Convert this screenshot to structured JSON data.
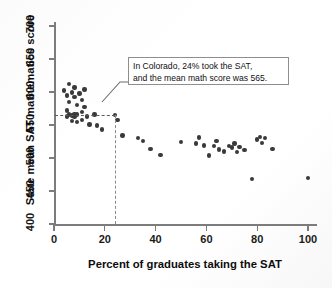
{
  "figure": {
    "background_color": "#ffffff",
    "point_color": "#3a3a3a",
    "axis_color": "#7c7c7c"
  },
  "annotation": {
    "line1": "In Colorado, 24% took the SAT,",
    "line2": "and the mean math score was 565.",
    "box_border_color": "#8e8e8e",
    "guide_x_value": 24,
    "guide_y_value": 565
  },
  "chart_data": {
    "type": "scatter",
    "title": "",
    "xlabel": "Percent of graduates taking the SAT",
    "ylabel": "State mean SAT mathematics score",
    "xlim": [
      0,
      105
    ],
    "ylim": [
      400,
      710
    ],
    "xticks": [
      0,
      20,
      40,
      60,
      80,
      100
    ],
    "yticks": [
      400,
      450,
      500,
      550,
      600,
      650,
      700
    ],
    "xtick_labels": [
      "0",
      "20",
      "40",
      "60",
      "80",
      "100"
    ],
    "ytick_labels": [
      "400",
      "450",
      "550",
      "550",
      "600",
      "650",
      "700"
    ],
    "grid": false,
    "legend": null,
    "highlight_point": {
      "label": "Colorado",
      "x": 24,
      "y": 565
    },
    "points": [
      {
        "x": 4,
        "y": 602
      },
      {
        "x": 5,
        "y": 595
      },
      {
        "x": 5,
        "y": 572
      },
      {
        "x": 5,
        "y": 563
      },
      {
        "x": 6,
        "y": 612
      },
      {
        "x": 6,
        "y": 585
      },
      {
        "x": 6,
        "y": 566
      },
      {
        "x": 7,
        "y": 599
      },
      {
        "x": 7,
        "y": 565
      },
      {
        "x": 7,
        "y": 564
      },
      {
        "x": 7,
        "y": 556
      },
      {
        "x": 8,
        "y": 607
      },
      {
        "x": 8,
        "y": 592
      },
      {
        "x": 8,
        "y": 567
      },
      {
        "x": 8,
        "y": 563
      },
      {
        "x": 9,
        "y": 580
      },
      {
        "x": 9,
        "y": 566
      },
      {
        "x": 9,
        "y": 555
      },
      {
        "x": 10,
        "y": 598
      },
      {
        "x": 11,
        "y": 588
      },
      {
        "x": 11,
        "y": 570
      },
      {
        "x": 11,
        "y": 558
      },
      {
        "x": 12,
        "y": 604
      },
      {
        "x": 12,
        "y": 577
      },
      {
        "x": 13,
        "y": 563
      },
      {
        "x": 14,
        "y": 551
      },
      {
        "x": 16,
        "y": 566
      },
      {
        "x": 17,
        "y": 549
      },
      {
        "x": 19,
        "y": 543
      },
      {
        "x": 24,
        "y": 565
      },
      {
        "x": 25,
        "y": 558
      },
      {
        "x": 27,
        "y": 534
      },
      {
        "x": 33,
        "y": 530
      },
      {
        "x": 35,
        "y": 526
      },
      {
        "x": 38,
        "y": 514
      },
      {
        "x": 42,
        "y": 505
      },
      {
        "x": 50,
        "y": 524
      },
      {
        "x": 56,
        "y": 522
      },
      {
        "x": 57,
        "y": 531
      },
      {
        "x": 59,
        "y": 519
      },
      {
        "x": 61,
        "y": 504
      },
      {
        "x": 63,
        "y": 518
      },
      {
        "x": 64,
        "y": 526
      },
      {
        "x": 65,
        "y": 513
      },
      {
        "x": 67,
        "y": 510
      },
      {
        "x": 69,
        "y": 518
      },
      {
        "x": 70,
        "y": 516
      },
      {
        "x": 71,
        "y": 522
      },
      {
        "x": 72,
        "y": 509
      },
      {
        "x": 73,
        "y": 517
      },
      {
        "x": 75,
        "y": 512
      },
      {
        "x": 78,
        "y": 468
      },
      {
        "x": 80,
        "y": 528
      },
      {
        "x": 81,
        "y": 532
      },
      {
        "x": 82,
        "y": 523
      },
      {
        "x": 83,
        "y": 530
      },
      {
        "x": 86,
        "y": 514
      },
      {
        "x": 100,
        "y": 470
      }
    ]
  }
}
